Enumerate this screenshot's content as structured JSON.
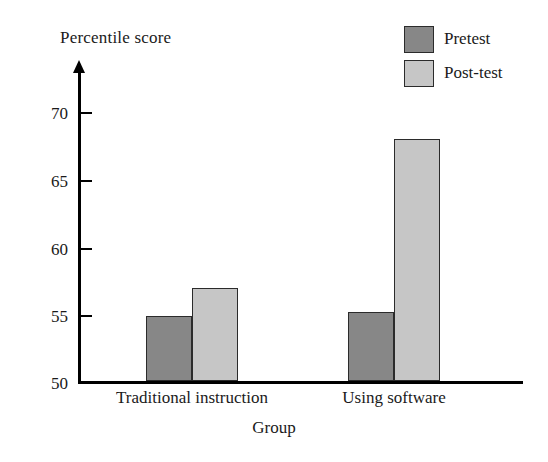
{
  "chart_data": {
    "type": "bar",
    "title": "",
    "xlabel": "Group",
    "ylabel": "Percentile score",
    "categories": [
      "Traditional instruction",
      "Using software"
    ],
    "series": [
      {
        "name": "Pretest",
        "values": [
          54.8,
          55.1
        ],
        "color": "#878787"
      },
      {
        "name": "Post-test",
        "values": [
          56.9,
          68.0
        ],
        "color": "#c6c6c6"
      }
    ],
    "ylim": [
      50,
      72
    ],
    "yticks": [
      50,
      55,
      60,
      65,
      70
    ],
    "ytick_labels": [
      "50",
      "55",
      "60",
      "65",
      "70"
    ],
    "grid": false,
    "legend_position": "top-right",
    "axis_style": "y-axis-with-arrow"
  },
  "axes": {
    "y_title": "Percentile score",
    "x_title": "Group",
    "y_ticks": [
      {
        "label": "70",
        "value": 70
      },
      {
        "label": "65",
        "value": 65
      },
      {
        "label": "60",
        "value": 60
      },
      {
        "label": "55",
        "value": 55
      },
      {
        "label": "50",
        "value": 50
      }
    ],
    "categories": [
      {
        "label": "Traditional instruction"
      },
      {
        "label": "Using software"
      }
    ]
  },
  "legend": {
    "items": [
      {
        "label": "Pretest",
        "color": "#878787"
      },
      {
        "label": "Post-test",
        "color": "#c6c6c6"
      }
    ]
  }
}
